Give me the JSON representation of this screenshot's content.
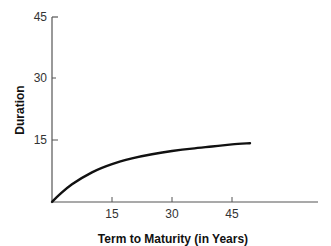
{
  "chart_data": {
    "type": "line",
    "title": "",
    "xlabel": "Term to Maturity (in Years)",
    "ylabel": "Duration",
    "xlim": [
      0,
      72
    ],
    "ylim": [
      0,
      45
    ],
    "x_ticks": [
      "15",
      "30",
      "45"
    ],
    "y_ticks": [
      "15",
      "30",
      "45"
    ],
    "grid": false,
    "legend": null,
    "series": [
      {
        "name": "Duration",
        "x": [
          0,
          2,
          5,
          10,
          15,
          20,
          25,
          30,
          35,
          40,
          45,
          49.5
        ],
        "y": [
          0,
          1.9,
          4.3,
          7.2,
          9.2,
          10.6,
          11.6,
          12.4,
          13.0,
          13.5,
          14.0,
          14.3
        ]
      }
    ],
    "color": "#111111"
  }
}
